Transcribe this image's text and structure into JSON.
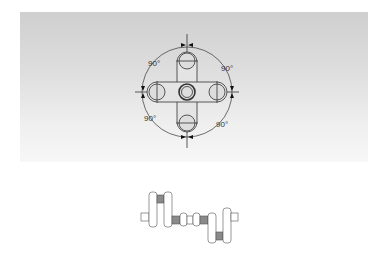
{
  "top_diagram": {
    "title": "crankshaft throw arrangement (end view)",
    "angle_labels": [
      "90°",
      "90°",
      "90°",
      "90°"
    ]
  },
  "bottom_diagram": {
    "title": "crankshaft side view"
  },
  "colors": {
    "panel_top": "#cfcfcf",
    "panel_bottom": "#f7f7f7",
    "line": "#333333",
    "crankpin_fill": "#8a8a8a"
  }
}
